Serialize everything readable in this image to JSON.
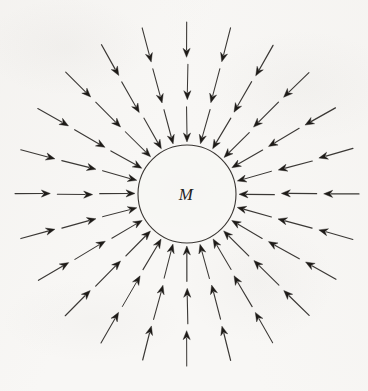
{
  "figure": {
    "background_color": "#f8f7f5",
    "ink_color": "#2b2825",
    "width": 368,
    "height": 391
  },
  "mass": {
    "label": "M",
    "label_x": 186,
    "label_y": 195,
    "circle": {
      "center_x": 187,
      "center_y": 194,
      "radius": 49,
      "stroke_color": "#3a3633",
      "stroke_width": 1.1,
      "fill": "none"
    }
  },
  "field": {
    "ray_count": 24,
    "angle_step_degrees": 15,
    "start_angle_degrees": 0,
    "direction": "inward",
    "segments_per_ray": 3,
    "inner_radius": 52,
    "outer_radius": 172,
    "segment_gap": 7,
    "line_color": "#2b2825",
    "line_width": 1.0,
    "arrowhead_length": 9,
    "arrowhead_half_width": 3.6,
    "arrowhead_color": "#1e1b18"
  },
  "chart_data": {
    "type": "scatter",
    "xlabel": "",
    "ylabel": "",
    "annotations": [
      "M"
    ],
    "series": [
      {
        "name": "field-lines",
        "description": "24 inward-pointing radial arrows, 15 degrees apart",
        "angles_degrees": [
          0,
          15,
          30,
          45,
          60,
          75,
          90,
          105,
          120,
          135,
          150,
          165,
          180,
          195,
          210,
          225,
          240,
          255,
          270,
          285,
          300,
          315,
          330,
          345
        ],
        "segments_per_ray": 3,
        "inner_radius": 52,
        "outer_radius": 172
      }
    ]
  }
}
